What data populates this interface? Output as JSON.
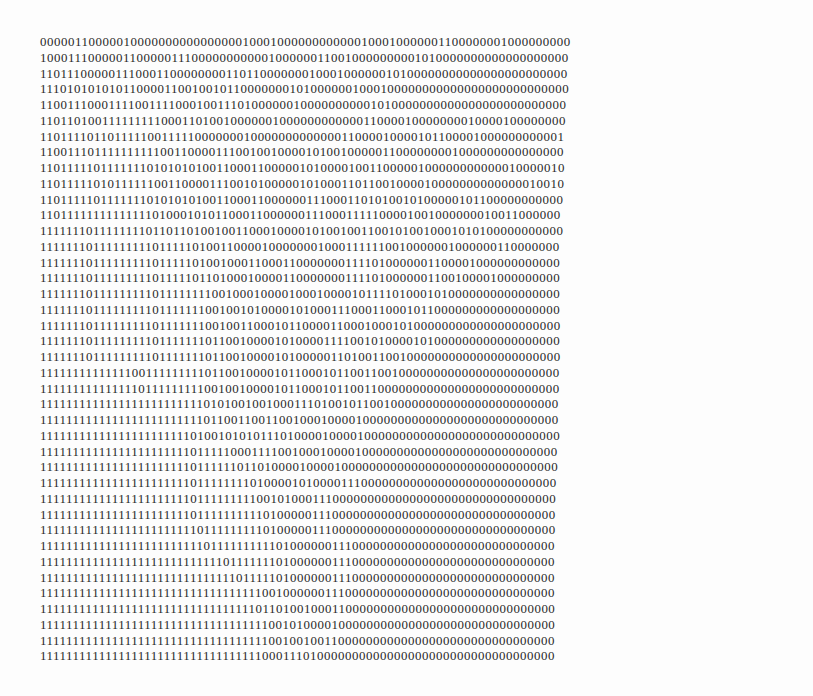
{
  "document": {
    "lines": [
      "000001100000100000000000000001000100000000000010001000000110000000100000000000000",
      "100011100000110000011100000000000100000011001000000000101000000000000000000000000",
      "110111000001110001100000000110110000000100010000001010000000000000000000000000000",
      "111010101010110000110010010110000000101000000100010000000000000000000000000000000",
      "110011100011110011110001001110100000010000000000101000000000000000000000000000001",
      "110110100111111111000110100100000010000000000001100001000000001000010000000000001",
      "110111101101111100111110000000100000000000001100001000010110000100000000000100100000",
      "110011101111111111001100001110010010000101001000001100000000100000000000000000000",
      "110111110111111101010101001100011000001010000100110000010000000000001000001000000",
      "110111110101111110011000011100101000001010001101100100001000000000000001001001000000",
      "110111110111111101010101001100011000000111000110101001010000010110000000000000000",
      "110111111111111110100010101100011000000111000111110000100100000001001100000000000000",
      "111111101111111101101101001001100010000101001001100101001000101010000000000000000000",
      "111111101111111110111110100110000100000001000111111001000000100000011000000000000000",
      "111111101111111110111110100100011000110000000111101000000110000100000000000000000000",
      "111111101111111110111110110100010000110000000111101000000110010000100000000000000000",
      "111111101111111110111111110010001000010001000010111101000101000000000000000000000000",
      "111111101111111110111111100100101000010100011100011000101100000000000000000000000000",
      "111111101111111110111111100100110001011000011000100010100000000000000000000000000000",
      "111111101111111110111111101100100001010000111100101000010100000000000000000000000000",
      "111111101111111110111111101100100001010000011010011001000000000000000000000000000000",
      "111111111111110011111111101100100001011000101100110010000000000000000000000000000000",
      "111111111111111011111111100100100001011000101100110000000000000000000000000000000000",
      "111111111111111111111111101010010010001110100101100100000000000000000000000000000000",
      "111111111111111111111111101100110011001000100001000000000000000000000000000000000000",
      "111111111111111111111110100101010111010000100001000000000000000000000000000000000000",
      "111111111111111111111110111110001111001000100001000000000000000000000000000000000000",
      "111111111111111111111110111111011010000100001000000000000000000000000000000000000000",
      "111111111111111111111110111111110100001010000111000000000000000000000000000000000000",
      "111111111111111111111110111111111001010001110000000000000000000000000000000000000000",
      "111111111111111111111110111111111101000001110000000000000000000000000000000000000000",
      "111111111111111111111111011111111101000001110000000000000000000000000000000000000000",
      "111111111111111111111111101111111111010000001110000000000000000000000000000000000000",
      "111111111111111111111111111101111111010000001110000000000000000000000000000000000000",
      "111111111111111111111111111111011111010000001110000000000000000000000000000000000000",
      "111111111111111111111111111111111100100000011100000000000000000000000000000000000000",
      "111111111111111111111111111111111011010010001100000000000000000000000000000000000000",
      "111111111111111111111111111111111110010100001000000000000000000000000000000000000000",
      "111111111111111111111111111111111110010010011000000000000000000000000000000000000000",
      "111111111111111111111111111111111100011101000000000000000000000000000000000000000000"
    ]
  }
}
